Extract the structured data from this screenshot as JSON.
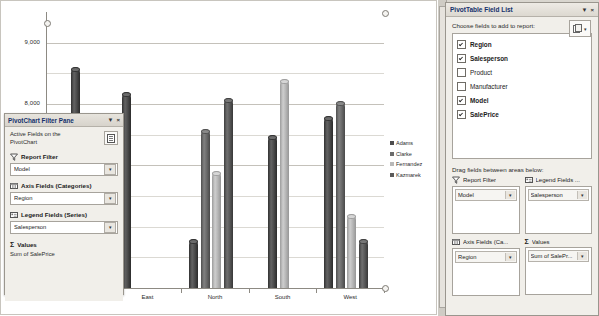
{
  "chart_data": {
    "type": "bar",
    "title": "",
    "xlabel": "",
    "ylabel": "",
    "categories": [
      "Central",
      "East",
      "North",
      "South",
      "West"
    ],
    "ylim": [
      5000,
      9500
    ],
    "yticks": [
      7000,
      8000,
      9000
    ],
    "ytick_labels": [
      "7,000",
      "8,000",
      "9,000"
    ],
    "grid": true,
    "legend_position": "right",
    "series": [
      {
        "name": "Adams",
        "color": "#4d4d4d",
        "values": [
          8600,
          8200,
          5800,
          7500,
          7800
        ]
      },
      {
        "name": "Clarke",
        "color": "#6b6b6b",
        "values": [
          null,
          1250,
          7600,
          null,
          8050
        ]
      },
      {
        "name": "Fernandez",
        "color": "#b8b8b8",
        "values": [
          null,
          3950,
          6900,
          8400,
          6200
        ]
      },
      {
        "name": "Kazmarek",
        "color": "#5a5a5a",
        "values": [
          null,
          3500,
          8100,
          null,
          5800
        ]
      }
    ]
  },
  "filter_pane": {
    "title": "PivotChart Filter Pane",
    "dropdown_glyph": "▼",
    "close_glyph": "×",
    "active_fields_text": "Active Fields on the PivotChart",
    "icon_button_name": "field-list-toggle",
    "sections": [
      {
        "label": "Report Filter",
        "icon": "funnel-icon",
        "value": "Model"
      },
      {
        "label": "Axis Fields (Categories)",
        "icon": "axis-icon",
        "value": "Region"
      },
      {
        "label": "Legend Fields (Series)",
        "icon": "legend-icon",
        "value": "Salesperson"
      }
    ],
    "values_label": "Values",
    "values_sigma": "Σ",
    "values_item": "Sum of SalePrice",
    "combo_arrow": "▼"
  },
  "field_list": {
    "title": "PivotTable Field List",
    "dropdown_glyph": "▼",
    "close_glyph": "×",
    "choose_label": "Choose fields to add to report:",
    "fields": [
      {
        "name": "Region",
        "checked": true
      },
      {
        "name": "Salesperson",
        "checked": true
      },
      {
        "name": "Product",
        "checked": false
      },
      {
        "name": "Manufacturer",
        "checked": false
      },
      {
        "name": "Model",
        "checked": true
      },
      {
        "name": "SalePrice",
        "checked": true
      }
    ],
    "drag_label": "Drag fields between areas below:",
    "areas": [
      {
        "header": "Report Filter",
        "icon": "funnel-icon",
        "value": "Model"
      },
      {
        "header": "Legend Fields ...",
        "icon": "legend-icon",
        "value": "Salesperson"
      },
      {
        "header": "Axis Fields (Ca...",
        "icon": "axis-icon",
        "value": "Region"
      },
      {
        "header": "Values",
        "icon": "sigma-icon",
        "value": "Sum of SalePr..."
      }
    ],
    "area_arrow": "▼",
    "sigma": "Σ"
  },
  "colors": {
    "pane_title_text": "#14306b",
    "plot_bg": "#ffffff",
    "grid": "#c4c1ba"
  }
}
